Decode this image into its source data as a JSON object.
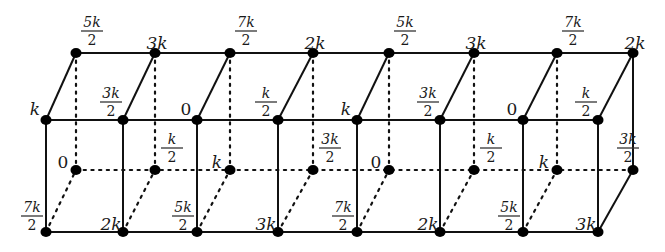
{
  "diagram": {
    "title": "",
    "rows": {
      "back_top": [
        "5k/2",
        "3k",
        "7k/2",
        "2k",
        "5k/2",
        "3k",
        "7k/2",
        "2k"
      ],
      "front_top": [
        "k",
        "3k/2",
        "0",
        "k/2",
        "k",
        "3k/2",
        "0",
        "k/2"
      ],
      "back_bottom": [
        "0",
        "k/2",
        "k",
        "3k/2",
        "0",
        "k/2",
        "k",
        "3k/2"
      ],
      "front_bottom": [
        "7k/2",
        "2k",
        "5k/2",
        "3k",
        "7k/2",
        "2k",
        "5k/2",
        "3k"
      ]
    },
    "hidden_edges_style": "dotted",
    "visible_edges_style": "solid",
    "colors": {
      "line": "#111111",
      "node": "#000000",
      "label": "#1a1a1a"
    }
  }
}
